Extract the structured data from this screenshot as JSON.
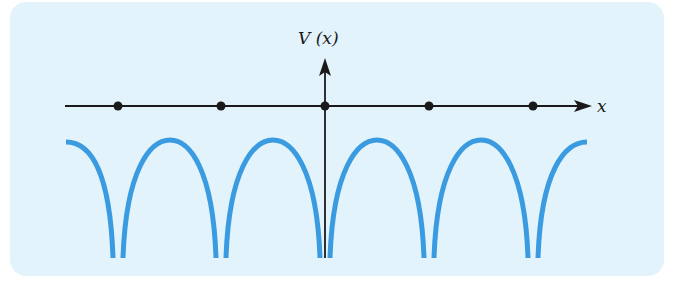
{
  "diagram": {
    "type": "periodic-potential",
    "y_axis_label": "V (x)",
    "x_axis_label": "x",
    "lattice_points": 5,
    "colors": {
      "background": "#e3f3fb",
      "curve": "#3a9be0",
      "axis": "#1a1a1a"
    }
  }
}
